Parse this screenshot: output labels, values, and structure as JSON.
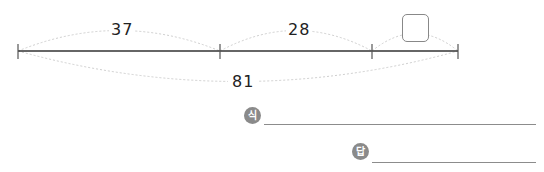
{
  "problem": {
    "segments": [
      {
        "label": "37"
      },
      {
        "label": "28"
      },
      {
        "label": ""
      }
    ],
    "total": {
      "label": "81"
    },
    "unknown_box": {
      "value": ""
    }
  },
  "answer_area": {
    "expression_badge": "식",
    "answer_badge": "답",
    "expression_value": "",
    "answer_value": ""
  }
}
